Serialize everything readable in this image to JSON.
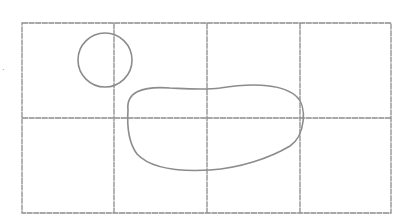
{
  "drawing": {
    "description": "Pencil sketch of a 4x2 grid with a small circle and a kidney-shaped blob",
    "stroke_color": "#8c8c8c",
    "grid": {
      "columns": 4,
      "rows": 2
    },
    "shapes": [
      "circle",
      "kidney-blob"
    ],
    "side_mark": "·"
  }
}
